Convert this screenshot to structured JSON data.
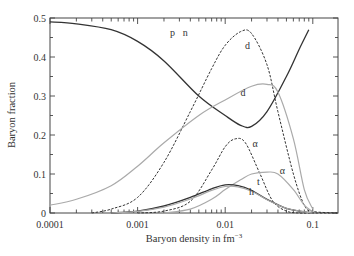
{
  "chart_data": {
    "type": "line",
    "title": "",
    "xlabel": "Baryon density in fm⁻³",
    "ylabel": "Baryon fraction",
    "xscale": "log",
    "xlim": [
      0.0001,
      0.19
    ],
    "ylim": [
      0,
      0.5
    ],
    "grid": false,
    "legend": "inline curve labels",
    "x_tick_labels": [
      "0.0001",
      "0.001",
      "0.01",
      "0.1"
    ],
    "x_ticks": [
      0.0001,
      0.001,
      0.01,
      0.1
    ],
    "y_tick_labels": [
      "0",
      "0.1",
      "0.2",
      "0.3",
      "0.4",
      "0.5"
    ],
    "y_ticks": [
      0,
      0.1,
      0.2,
      0.3,
      0.4,
      0.5
    ],
    "series": [
      {
        "name": "p n",
        "label": "p   n",
        "style": "solid-dark",
        "x": [
          0.0001,
          0.0002,
          0.0005,
          0.001,
          0.002,
          0.005,
          0.01,
          0.015,
          0.02,
          0.03,
          0.05,
          0.07,
          0.09
        ],
        "values": [
          0.49,
          0.485,
          0.47,
          0.44,
          0.39,
          0.3,
          0.25,
          0.225,
          0.222,
          0.26,
          0.35,
          0.42,
          0.47
        ]
      },
      {
        "name": "d (dashed)",
        "label": "d",
        "style": "dashed",
        "x": [
          0.0003,
          0.0005,
          0.001,
          0.002,
          0.004,
          0.007,
          0.01,
          0.015,
          0.02,
          0.03,
          0.04,
          0.06,
          0.08,
          0.1,
          0.19
        ],
        "values": [
          0.0,
          0.01,
          0.04,
          0.13,
          0.26,
          0.37,
          0.43,
          0.465,
          0.46,
          0.38,
          0.26,
          0.1,
          0.02,
          0.004,
          0.0
        ]
      },
      {
        "name": "d (solid gray)",
        "label": "d",
        "style": "solid-gray",
        "x": [
          0.0001,
          0.0002,
          0.0005,
          0.001,
          0.002,
          0.005,
          0.01,
          0.02,
          0.03,
          0.04,
          0.06,
          0.08,
          0.1
        ],
        "values": [
          0.02,
          0.035,
          0.07,
          0.12,
          0.18,
          0.25,
          0.29,
          0.325,
          0.33,
          0.31,
          0.19,
          0.06,
          0.01
        ]
      },
      {
        "name": "α (dashed)",
        "label": "α",
        "style": "dashed",
        "x": [
          0.001,
          0.002,
          0.004,
          0.007,
          0.01,
          0.013,
          0.017,
          0.025,
          0.035,
          0.05,
          0.07,
          0.1,
          0.19
        ],
        "values": [
          0.0,
          0.005,
          0.03,
          0.11,
          0.17,
          0.19,
          0.18,
          0.1,
          0.03,
          0.005,
          0.0,
          0.0,
          0.0
        ]
      },
      {
        "name": "α (solid gray)",
        "label": "α",
        "style": "solid-gray",
        "x": [
          0.002,
          0.004,
          0.007,
          0.01,
          0.015,
          0.02,
          0.03,
          0.04,
          0.06,
          0.08,
          0.1
        ],
        "values": [
          0.0,
          0.01,
          0.035,
          0.06,
          0.085,
          0.1,
          0.105,
          0.1,
          0.06,
          0.02,
          0.003
        ]
      },
      {
        "name": "t",
        "label": "t",
        "style": "solid-dark",
        "x": [
          0.0005,
          0.001,
          0.002,
          0.004,
          0.007,
          0.01,
          0.014,
          0.02,
          0.03,
          0.05,
          0.08,
          0.1
        ],
        "values": [
          0.0,
          0.005,
          0.018,
          0.04,
          0.062,
          0.072,
          0.07,
          0.058,
          0.035,
          0.012,
          0.003,
          0.0
        ]
      },
      {
        "name": "h",
        "label": "h",
        "style": "solid-gray",
        "x": [
          0.0005,
          0.001,
          0.002,
          0.004,
          0.007,
          0.01,
          0.014,
          0.02,
          0.03,
          0.05,
          0.08,
          0.1
        ],
        "values": [
          0.0,
          0.004,
          0.015,
          0.036,
          0.058,
          0.068,
          0.067,
          0.056,
          0.034,
          0.012,
          0.003,
          0.0
        ]
      }
    ],
    "annotations": [
      {
        "text": "p",
        "x": 0.0025,
        "y": 0.455
      },
      {
        "text": "n",
        "x": 0.0035,
        "y": 0.455
      },
      {
        "text": "d",
        "x": 0.018,
        "y": 0.42
      },
      {
        "text": "d",
        "x": 0.016,
        "y": 0.3
      },
      {
        "text": "α",
        "x": 0.022,
        "y": 0.17
      },
      {
        "text": "α",
        "x": 0.045,
        "y": 0.1
      },
      {
        "text": "t",
        "x": 0.024,
        "y": 0.072
      },
      {
        "text": "h",
        "x": 0.02,
        "y": 0.045
      }
    ]
  },
  "axes": {
    "xlabel_main": "Baryon density in fm",
    "xlabel_sup": "−3",
    "ylabel": "Baryon fraction"
  }
}
